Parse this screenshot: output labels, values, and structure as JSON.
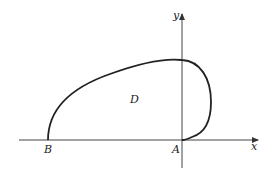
{
  "diagram": {
    "type": "region-in-plane",
    "axes": {
      "x_label": "x",
      "y_label": "y"
    },
    "points": {
      "A": "A",
      "B": "B"
    },
    "region_label": "D",
    "colors": {
      "stroke": "#222222",
      "axis": "#444444",
      "background": "#ffffff"
    }
  }
}
